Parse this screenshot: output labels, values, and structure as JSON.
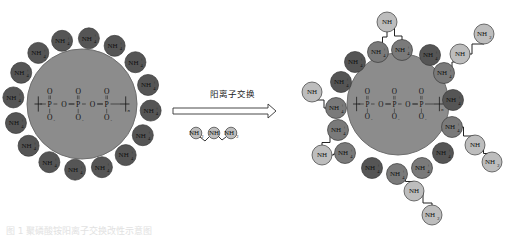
{
  "arrow_label": "阳离子交换",
  "caption": "图 1  聚磷酸铵阳离子交换改性示意图",
  "core": {
    "formula_atoms": [
      "O",
      "P",
      "O",
      "P",
      "O",
      "P",
      "O",
      "O",
      "O",
      "O",
      "O",
      "O"
    ],
    "repeat_subscript": "n",
    "color": "#8a8a8a"
  },
  "ion_label": "NH",
  "ion_subscript_4": "4",
  "ion_subscript_3": "3",
  "ion_subscript_2": "2",
  "left_ions_count": 16,
  "colors": {
    "dark_ion": "#555555",
    "mid_ion": "#7a7a7a",
    "light_ion": "#bdbdbd",
    "core": "#8c8c8c",
    "core_edge": "#6a6a6a"
  },
  "reagent": {
    "labels": [
      "NH2",
      "NH",
      "NH2"
    ]
  },
  "right_chains": [
    {
      "labels": [
        "NH4+",
        "NH",
        "NH4+"
      ]
    },
    {
      "labels": [
        "NH4+",
        "NH",
        "NH2"
      ]
    },
    {
      "labels": [
        "NH4+",
        "NH",
        "NH2"
      ]
    },
    {
      "labels": [
        "NH4+",
        "NH",
        "NH2"
      ]
    },
    {
      "labels": [
        "NH4+",
        "NH"
      ]
    },
    {
      "labels": [
        "NH4+",
        "NH",
        "NH4+"
      ]
    }
  ]
}
